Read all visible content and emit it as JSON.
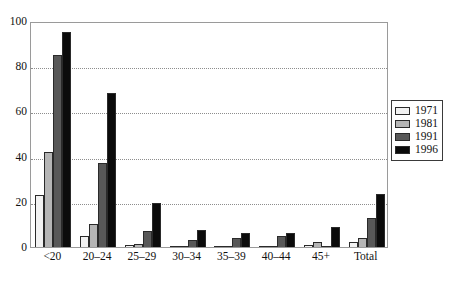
{
  "chart_data": {
    "type": "bar",
    "title": "",
    "subtitle": "",
    "xlabel": "",
    "ylabel": "",
    "grid": true,
    "legend_position": "right",
    "ylim": [
      0,
      100
    ],
    "yticks": [
      0,
      20,
      40,
      60,
      80,
      100
    ],
    "categories": [
      "<20",
      "20–24",
      "25–29",
      "30–34",
      "35–39",
      "40–44",
      "45+",
      "Total"
    ],
    "series": [
      {
        "name": "1971",
        "color": "#f2f2f2",
        "values": [
          23,
          5,
          1,
          0.4,
          0.3,
          0.3,
          1,
          2
        ]
      },
      {
        "name": "1981",
        "color": "#b5b5b5",
        "values": [
          42,
          10,
          1.5,
          0.6,
          0.5,
          0.5,
          2,
          4
        ]
      },
      {
        "name": "1991",
        "color": "#585858",
        "values": [
          85,
          37,
          7,
          3,
          4,
          5,
          0.5,
          13
        ]
      },
      {
        "name": "1996",
        "color": "#0b0b0b",
        "values": [
          95,
          68,
          19.5,
          7.5,
          6,
          6,
          9,
          23.5
        ]
      }
    ]
  },
  "legend": {
    "entries": [
      {
        "label": "1971"
      },
      {
        "label": "1981"
      },
      {
        "label": "1991"
      },
      {
        "label": "1996"
      }
    ]
  }
}
